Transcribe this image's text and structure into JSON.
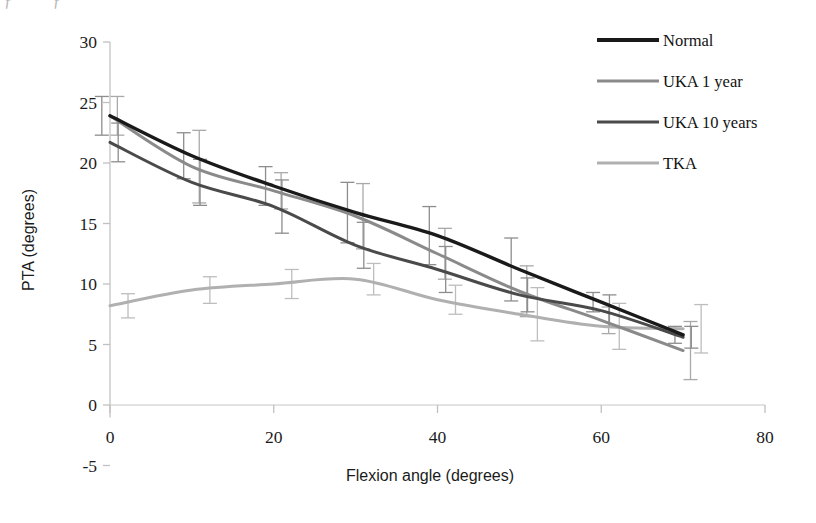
{
  "figure": {
    "partial_caption_above": "ƒ ƒ",
    "background": "#ffffff"
  },
  "chart_data": {
    "type": "line",
    "title": "",
    "xlabel": "Flexion angle (degrees)",
    "ylabel": "PTA (degrees)",
    "xlim": [
      0,
      80
    ],
    "ylim": [
      -5,
      30
    ],
    "xticks": [
      0,
      20,
      40,
      60,
      80
    ],
    "yticks": [
      -5,
      0,
      5,
      10,
      15,
      20,
      25,
      30
    ],
    "xtick_labels": [
      "0",
      "20",
      "40",
      "60",
      "80"
    ],
    "ytick_labels": [
      "-5",
      "0",
      "5",
      "10",
      "15",
      "20",
      "25",
      "30"
    ],
    "grid": false,
    "legend_position": "top-right",
    "x": [
      0,
      10,
      20,
      30,
      40,
      50,
      60,
      70
    ],
    "series": [
      {
        "name": "Normal",
        "color": "#1a1a1a",
        "values": [
          23.9,
          20.6,
          18.1,
          15.9,
          14.0,
          11.2,
          8.5,
          5.8
        ],
        "errors": [
          1.6,
          1.9,
          1.6,
          2.5,
          2.4,
          2.6,
          0.8,
          0.7
        ]
      },
      {
        "name": "UKA 1 year",
        "color": "#8a8a8a",
        "values": [
          23.9,
          19.7,
          17.7,
          15.6,
          12.5,
          9.4,
          7.0,
          4.5
        ],
        "errors": [
          1.6,
          3.0,
          1.5,
          2.7,
          2.1,
          2.1,
          1.1,
          2.4
        ]
      },
      {
        "name": "UKA 10 years",
        "color": "#4a4a4a",
        "values": [
          21.7,
          18.4,
          16.4,
          13.2,
          11.2,
          9.1,
          7.8,
          5.6
        ],
        "errors": [
          1.6,
          1.9,
          2.2,
          1.9,
          1.9,
          1.4,
          1.3,
          0.9
        ]
      },
      {
        "name": "TKA",
        "color": "#b0b0b0",
        "values": [
          8.2,
          9.5,
          10.0,
          10.4,
          8.7,
          7.5,
          6.5,
          6.3
        ],
        "errors": [
          1.0,
          1.1,
          1.2,
          1.3,
          1.2,
          2.2,
          1.9,
          2.0
        ]
      }
    ]
  },
  "legend": {
    "items": [
      {
        "label": "Normal",
        "color": "#1a1a1a"
      },
      {
        "label": "UKA 1 year",
        "color": "#8a8a8a"
      },
      {
        "label": "UKA 10 years",
        "color": "#4a4a4a"
      },
      {
        "label": "TKA",
        "color": "#b0b0b0"
      }
    ]
  }
}
